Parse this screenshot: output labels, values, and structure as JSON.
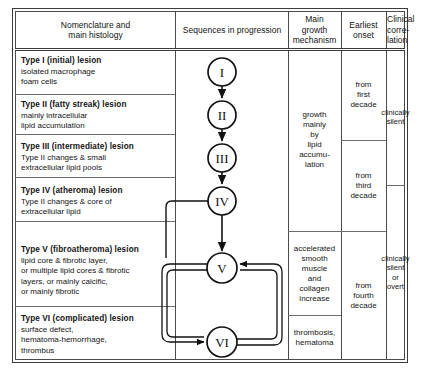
{
  "table": {
    "headers": [
      {
        "id": "nomenclature",
        "label": "Nomenclature and\nmain histology"
      },
      {
        "id": "sequences",
        "label": "Sequences in progression"
      },
      {
        "id": "mechanism",
        "label": "Main\ngrowth\nmechanism"
      },
      {
        "id": "onset",
        "label": "Earliest\nonset"
      },
      {
        "id": "correlation",
        "label": "Clinical\ncorre-\nlation"
      }
    ],
    "lesions": [
      {
        "id": "type-1",
        "title": "Type I (initial) lesion",
        "description": "isolated macrophage\nfoam cells"
      },
      {
        "id": "type-2",
        "title": "Type II (fatty streak) lesion",
        "description": "mainly intracellular\nlipid accumulation"
      },
      {
        "id": "type-3",
        "title": "Type III (intermediate) lesion",
        "description": "Type II changes & small\nextracellular lipid pools"
      },
      {
        "id": "type-4",
        "title": "Type IV (atheroma) lesion",
        "description": "Type II changes & core of\nextracellular lipid"
      },
      {
        "id": "type-5",
        "title": "Type V (fibroatheroma) lesion",
        "description": "lipid core & fibrotic layer,\nor multiple lipid cores & fibrotic\nlayers, or mainly calcific,\nor mainly fibrotic"
      },
      {
        "id": "type-6",
        "title": "Type VI (complicated) lesion",
        "description": "surface defect,\nhematoma-hemorrhage,\nthrombus"
      }
    ],
    "mechanism_cells": [
      {
        "id": "mechanism-lipid",
        "text": "growth\nmainly\nby\nlipid\naccumu-\nlation"
      },
      {
        "id": "mechanism-smooth-muscle",
        "text": "accelerated\nsmooth\nmuscle\nand\ncollagen\nincrease"
      },
      {
        "id": "mechanism-thrombosis",
        "text": "thrombosis,\nhematoma"
      }
    ],
    "onset_cells": [
      {
        "id": "onset-first-decade",
        "text": "from\nfirst\ndecade"
      },
      {
        "id": "onset-third-decade",
        "text": "from\nthird\ndecade"
      },
      {
        "id": "onset-fourth-decade",
        "text": "from\nfourth\ndecade"
      }
    ],
    "correlation_cells": [
      {
        "id": "correlation-silent",
        "text": "clinically\nsilent"
      },
      {
        "id": "correlation-silent-or-overt",
        "text": "clinically\nsilent\nor\novert"
      }
    ]
  },
  "flow": {
    "nodes": [
      {
        "id": "node-1",
        "label": "I",
        "cx": 222,
        "cy": 72
      },
      {
        "id": "node-2",
        "label": "II",
        "cx": 222,
        "cy": 115
      },
      {
        "id": "node-3",
        "label": "III",
        "cx": 222,
        "cy": 158
      },
      {
        "id": "node-4",
        "label": "IV",
        "cx": 222,
        "cy": 201
      },
      {
        "id": "node-5",
        "label": "V",
        "cx": 222,
        "cy": 268
      },
      {
        "id": "node-6",
        "label": "VI",
        "cx": 222,
        "cy": 342
      }
    ],
    "radius": 14,
    "edges": [
      {
        "id": "edge-1-2",
        "from": "I",
        "to": "II",
        "kind": "straight-arrow"
      },
      {
        "id": "edge-2-3",
        "from": "II",
        "to": "III",
        "kind": "straight-arrow"
      },
      {
        "id": "edge-3-4",
        "from": "III",
        "to": "IV",
        "kind": "straight-arrow"
      },
      {
        "id": "edge-4-5",
        "from": "IV",
        "to": "V",
        "kind": "straight-arrow"
      },
      {
        "id": "edge-4-6",
        "from": "IV",
        "to": "VI",
        "kind": "left-loop-arrow"
      },
      {
        "id": "edge-5-6",
        "from": "V",
        "to": "VI",
        "kind": "left-double-loop-arrow"
      },
      {
        "id": "edge-6-5",
        "from": "VI",
        "to": "V",
        "kind": "right-double-loop-arrow"
      }
    ]
  },
  "colors": {
    "border": "#3b3b3b",
    "grid": "#6b6b6b",
    "text": "#141414",
    "background": "#ffffff"
  }
}
